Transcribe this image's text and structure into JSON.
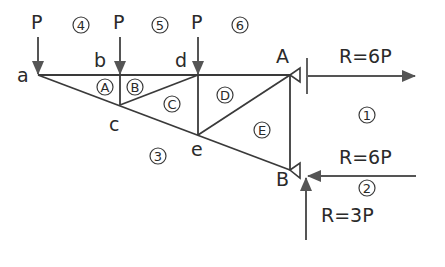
{
  "diagram": {
    "type": "truss-force-diagram",
    "colors": {
      "member": "#3a3a3a",
      "arrow": "#555555",
      "text": "#2a2a2a"
    },
    "nodes": [
      {
        "id": "a",
        "label": "a",
        "x": 38,
        "y": 75
      },
      {
        "id": "b",
        "label": "b",
        "x": 120,
        "y": 75
      },
      {
        "id": "d",
        "label": "d",
        "x": 198,
        "y": 75
      },
      {
        "id": "A",
        "label": "A",
        "x": 290,
        "y": 75
      },
      {
        "id": "c",
        "label": "c",
        "x": 120,
        "y": 105
      },
      {
        "id": "e",
        "label": "e",
        "x": 198,
        "y": 135
      },
      {
        "id": "B",
        "label": "B",
        "x": 290,
        "y": 170
      }
    ],
    "loads": [
      {
        "label": "P",
        "at": "a"
      },
      {
        "label": "P",
        "at": "b"
      },
      {
        "label": "P",
        "at": "d"
      }
    ],
    "reactions": [
      {
        "label": "R=6P",
        "at": "A",
        "direction": "right"
      },
      {
        "label": "R=6P",
        "at": "B",
        "direction": "left"
      },
      {
        "label": "R=3P",
        "at": "B",
        "direction": "up"
      }
    ],
    "zone_labels": {
      "outer": [
        "①",
        "②",
        "③",
        "④",
        "⑤",
        "⑥"
      ],
      "inner": [
        "A",
        "B",
        "C",
        "D",
        "E"
      ]
    }
  }
}
